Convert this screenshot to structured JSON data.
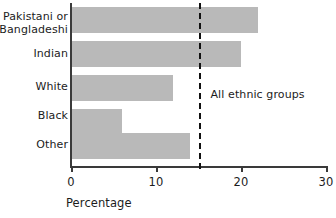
{
  "chart_data": {
    "type": "bar",
    "orientation": "horizontal",
    "title": "",
    "xlabel": "Percentage",
    "ylabel": "",
    "categories": [
      "Pakistani or\nBangladeshi",
      "Indian",
      "White",
      "Black",
      "Other"
    ],
    "values": [
      22,
      20,
      12,
      6,
      14
    ],
    "xlim": [
      0,
      30
    ],
    "xticks": [
      0,
      10,
      20,
      30
    ],
    "xtick_labels": [
      "0",
      "10",
      "20",
      "30"
    ],
    "grid": false,
    "legend": false,
    "bar_color": "#b9b9b9",
    "axis_color": "#3a3a3a",
    "annotations": [
      {
        "name": "reference-line",
        "label": "All ethnic groups",
        "value": 15,
        "style": "dashed",
        "color": "#111111"
      }
    ]
  }
}
